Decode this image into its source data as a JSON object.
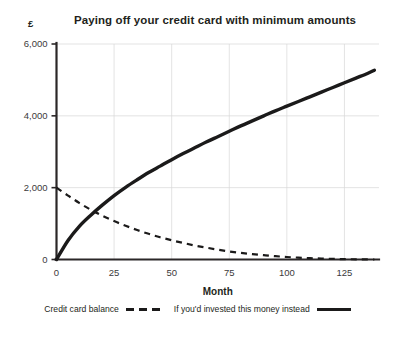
{
  "chart_data": {
    "type": "line",
    "title": "Paying off your credit card with minimum amounts",
    "xlabel": "Month",
    "ylabel": "",
    "y_unit": "£",
    "xlim": [
      0,
      140
    ],
    "ylim": [
      0,
      6000
    ],
    "xticks": [
      0,
      25,
      50,
      75,
      100,
      125
    ],
    "xtick_labels": [
      "0",
      "25",
      "50",
      "75",
      "100",
      "125"
    ],
    "yticks": [
      0,
      2000,
      4000,
      6000
    ],
    "ytick_labels": [
      "0",
      "2,000",
      "4,000",
      "6,000"
    ],
    "grid": "both",
    "legend_position": "bottom",
    "x": [
      0,
      5,
      10,
      15,
      20,
      25,
      30,
      35,
      40,
      45,
      50,
      55,
      60,
      65,
      70,
      75,
      80,
      85,
      90,
      95,
      100,
      105,
      110,
      115,
      120,
      125,
      130,
      135,
      138
    ],
    "series": [
      {
        "name": "Credit card balance",
        "style": "dashed",
        "color": "#1b1a1a",
        "values": [
          2000,
          1780,
          1570,
          1380,
          1215,
          1070,
          940,
          820,
          715,
          620,
          535,
          460,
          390,
          330,
          275,
          225,
          185,
          150,
          120,
          92,
          70,
          52,
          38,
          26,
          17,
          10,
          5,
          2,
          0
        ]
      },
      {
        "name": "If you'd invested this money instead",
        "style": "solid",
        "color": "#1b1a1a",
        "values": [
          0,
          530,
          930,
          1240,
          1520,
          1780,
          2010,
          2220,
          2420,
          2600,
          2780,
          2950,
          3110,
          3270,
          3420,
          3570,
          3720,
          3860,
          4000,
          4140,
          4270,
          4400,
          4530,
          4660,
          4790,
          4920,
          5050,
          5180,
          5270
        ]
      }
    ],
    "annotations": []
  },
  "legend": {
    "items": [
      {
        "label": "Credit card balance",
        "marker": "dashed"
      },
      {
        "label": "If you'd invested this money instead",
        "marker": "solid"
      }
    ]
  }
}
